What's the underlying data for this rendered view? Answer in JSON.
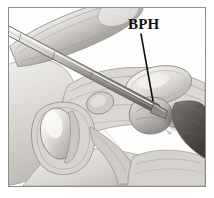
{
  "figure": {
    "kind": "medical-illustration",
    "style": "grayscale-pencil-rendering",
    "frame": {
      "border_color": "#8d8d8d",
      "background_color": "#ffffff",
      "x": 8,
      "y": 7,
      "width": 198,
      "height": 180
    }
  },
  "annotations": {
    "bph": {
      "label": "BPH",
      "text_color": "#111111",
      "leader_line_color": "#111111",
      "leader_from": {
        "x": 141,
        "y": 34
      },
      "leader_to": {
        "x": 153,
        "y": 101
      }
    }
  },
  "palette": {
    "background": "#ffffff",
    "tissue_light": "#e9e7e4",
    "tissue_mid": "#c8c5c1",
    "tissue_dark": "#9a9690",
    "tissue_shadow": "#6f6b66",
    "cavity_dark": "#4a4744",
    "instrument_highlight": "#f2f1ef",
    "instrument_shadow": "#58555200",
    "outline": "#6b6864"
  },
  "regions": [
    {
      "name": "penis-shaft",
      "label": ""
    },
    {
      "name": "resectoscope-instrument",
      "label": ""
    },
    {
      "name": "scrotum-testicle",
      "label": ""
    },
    {
      "name": "prostate-gland",
      "label": ""
    },
    {
      "name": "bladder",
      "label": ""
    },
    {
      "name": "rectum",
      "label": ""
    },
    {
      "name": "pubic-bone",
      "label": ""
    },
    {
      "name": "abdominal-wall",
      "label": ""
    }
  ]
}
